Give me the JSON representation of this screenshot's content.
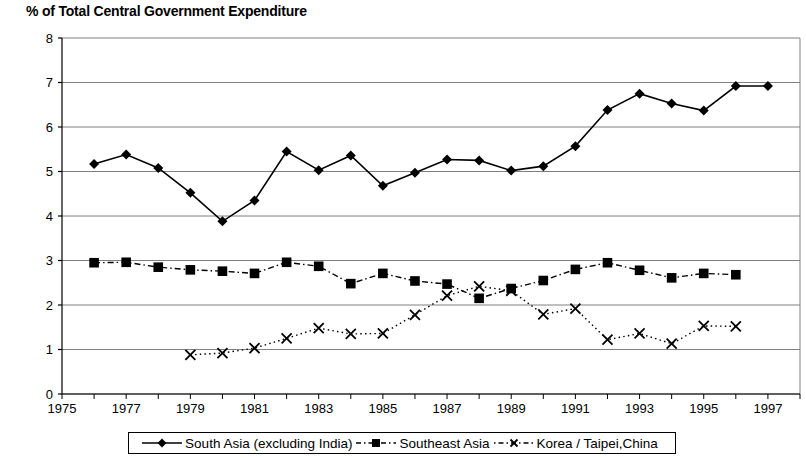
{
  "chart_data": {
    "type": "line",
    "title": "% of Total Central Government Expenditure",
    "xlabel": "",
    "ylabel": "",
    "xlim": [
      1975,
      1998
    ],
    "ylim": [
      0,
      8
    ],
    "yticks": [
      0,
      1,
      2,
      3,
      4,
      5,
      6,
      7,
      8
    ],
    "ytick_labels": [
      "0",
      "1",
      "2",
      "3",
      "4",
      "5",
      "6",
      "7",
      "8"
    ],
    "xticks": [
      1975,
      1976,
      1977,
      1978,
      1979,
      1980,
      1981,
      1982,
      1983,
      1984,
      1985,
      1986,
      1987,
      1988,
      1989,
      1990,
      1991,
      1992,
      1993,
      1994,
      1995,
      1996,
      1997,
      1998
    ],
    "xtick_labels_shown": [
      "1975",
      "1977",
      "1979",
      "1981",
      "1983",
      "1985",
      "1987",
      "1989",
      "1991",
      "1993",
      "1995",
      "1997"
    ],
    "grid": "horizontal",
    "legend_position": "bottom",
    "series": [
      {
        "name": "South Asia (excluding India)",
        "marker": "diamond",
        "line_style": "solid",
        "color": "#000000",
        "x": [
          1976,
          1977,
          1978,
          1979,
          1980,
          1981,
          1982,
          1983,
          1984,
          1985,
          1986,
          1987,
          1988,
          1989,
          1990,
          1991,
          1992,
          1993,
          1994,
          1995,
          1996,
          1997
        ],
        "values": [
          5.17,
          5.38,
          5.08,
          4.52,
          3.88,
          4.35,
          5.45,
          5.03,
          5.36,
          4.68,
          4.97,
          5.27,
          5.25,
          5.02,
          5.12,
          5.57,
          6.38,
          6.75,
          6.53,
          6.37,
          6.92,
          6.92
        ]
      },
      {
        "name": "Southeast Asia",
        "marker": "square",
        "line_style": "dash-dot",
        "color": "#000000",
        "x": [
          1976,
          1977,
          1978,
          1979,
          1980,
          1981,
          1982,
          1983,
          1984,
          1985,
          1986,
          1987,
          1988,
          1989,
          1990,
          1991,
          1992,
          1993,
          1994,
          1995,
          1996
        ],
        "values": [
          2.95,
          2.96,
          2.85,
          2.79,
          2.76,
          2.71,
          2.96,
          2.87,
          2.48,
          2.71,
          2.54,
          2.47,
          2.15,
          2.37,
          2.55,
          2.8,
          2.95,
          2.78,
          2.61,
          2.71,
          2.68
        ]
      },
      {
        "name": "Korea / Taipei,China",
        "marker": "x",
        "line_style": "dotted",
        "color": "#000000",
        "x": [
          1979,
          1980,
          1981,
          1982,
          1983,
          1984,
          1985,
          1986,
          1987,
          1988,
          1989,
          1990,
          1991,
          1992,
          1993,
          1994,
          1995,
          1996
        ],
        "values": [
          0.88,
          0.92,
          1.03,
          1.25,
          1.48,
          1.35,
          1.36,
          1.78,
          2.21,
          2.42,
          2.32,
          1.79,
          1.92,
          1.22,
          1.36,
          1.13,
          1.53,
          1.52
        ]
      }
    ]
  },
  "legend": {
    "entries": [
      {
        "label": "South Asia (excluding India)",
        "marker": "diamond",
        "style": "solid"
      },
      {
        "label": "Southeast Asia",
        "marker": "square",
        "style": "dash-dot"
      },
      {
        "label": "Korea / Taipei,China",
        "marker": "x",
        "style": "dotted"
      }
    ]
  }
}
